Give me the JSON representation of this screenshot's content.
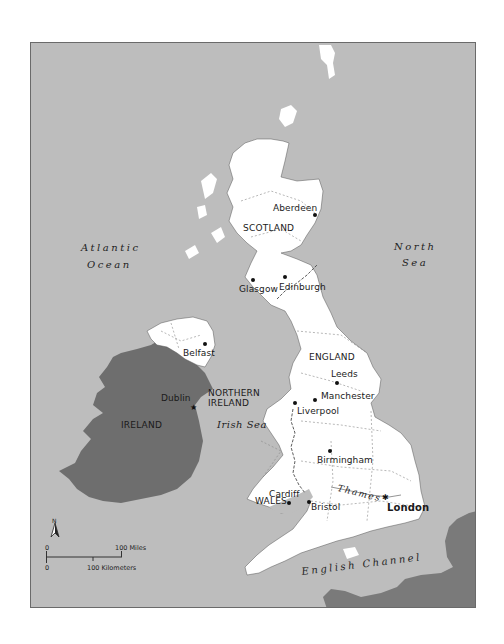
{
  "map": {
    "colors": {
      "sea": "#bdbdbd",
      "uk_land": "#ffffff",
      "ireland_land": "#6e6e6e",
      "france_land": "#7a7a7a",
      "border": "#6a6a6a"
    },
    "countries": [
      {
        "id": "scotland",
        "label": "SCOTLAND"
      },
      {
        "id": "england",
        "label": "ENGLAND"
      },
      {
        "id": "wales",
        "label": "WALES"
      },
      {
        "id": "northern-ireland",
        "label_line1": "NORTHERN",
        "label_line2": "IRELAND"
      },
      {
        "id": "ireland",
        "label": "IRELAND"
      }
    ],
    "cities": [
      {
        "id": "aberdeen",
        "label": "Aberdeen"
      },
      {
        "id": "glasgow",
        "label": "Glasgow"
      },
      {
        "id": "edinburgh",
        "label": "Edinburgh"
      },
      {
        "id": "belfast",
        "label": "Belfast"
      },
      {
        "id": "dublin",
        "label": "Dublin",
        "marker": "capital-star"
      },
      {
        "id": "leeds",
        "label": "Leeds"
      },
      {
        "id": "manchester",
        "label": "Manchester"
      },
      {
        "id": "liverpool",
        "label": "Liverpool"
      },
      {
        "id": "birmingham",
        "label": "Birmingham"
      },
      {
        "id": "cardiff",
        "label": "Cardiff"
      },
      {
        "id": "bristol",
        "label": "Bristol"
      },
      {
        "id": "london",
        "label": "London",
        "marker": "capital-star"
      }
    ],
    "water": [
      {
        "id": "atlantic",
        "line1": "Atlantic",
        "line2": "Ocean"
      },
      {
        "id": "north-sea",
        "line1": "North",
        "line2": "Sea"
      },
      {
        "id": "irish-sea",
        "label": "Irish Sea"
      },
      {
        "id": "english-channel",
        "label": "English Channel"
      },
      {
        "id": "thames",
        "label": "Thames"
      }
    ],
    "compass": {
      "label": "N",
      "icon": "north-arrow-icon"
    },
    "scale_bar": {
      "miles_start": "0",
      "miles_end": "100 Miles",
      "km_start": "0",
      "km_end": "100 Kilometers"
    }
  }
}
